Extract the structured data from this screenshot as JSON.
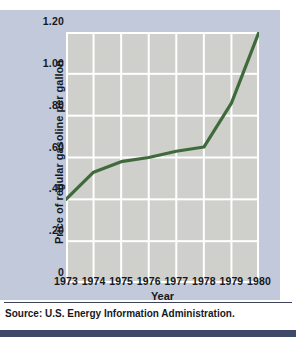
{
  "chart_data": {
    "type": "line",
    "title": "",
    "xlabel": "Year",
    "ylabel": "Price of regular gasoline per gallon",
    "x": [
      1973,
      1974,
      1975,
      1976,
      1977,
      1978,
      1979,
      1980
    ],
    "categories": [
      "1973",
      "1974",
      "1975",
      "1976",
      "1977",
      "1978",
      "1979",
      "1980"
    ],
    "values": [
      0.4,
      0.53,
      0.58,
      0.6,
      0.63,
      0.65,
      0.86,
      1.2
    ],
    "series": [
      {
        "name": "Price of regular gasoline per gallon",
        "values": [
          0.4,
          0.53,
          0.58,
          0.6,
          0.63,
          0.65,
          0.86,
          1.2
        ],
        "color": "#3f6b3c"
      }
    ],
    "xlim": [
      1973,
      1980
    ],
    "ylim": [
      0,
      1.2
    ],
    "ytick_labels": [
      "1.20",
      "1.00",
      ".80",
      ".60",
      ".40",
      ".20",
      "0"
    ],
    "ytick_values": [
      1.2,
      1.0,
      0.8,
      0.6,
      0.4,
      0.2,
      0
    ],
    "xtick_labels": [
      "1973",
      "1974",
      "1975",
      "1976",
      "1977",
      "1978",
      "1979",
      "1980"
    ],
    "grid": true,
    "legend": "none",
    "line_color": "#3f6b3c",
    "plot_bg": "#cfcfcb",
    "figure_bg": "#c2c9da",
    "grid_color": "#ffffff"
  },
  "footer": {
    "source": "Source: U.S. Energy Information Administration."
  }
}
